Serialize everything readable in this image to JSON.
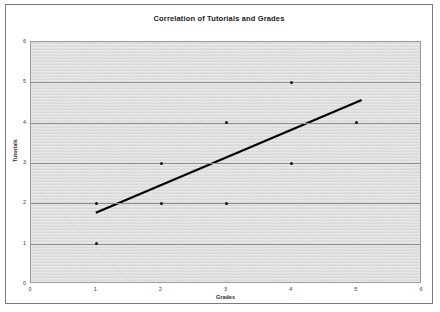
{
  "chart_data": {
    "type": "scatter",
    "title": "Correlation of Tutorials and Grades",
    "xlabel": "Grades",
    "ylabel": "Tutorials",
    "xlim": [
      0,
      6
    ],
    "ylim": [
      0,
      6
    ],
    "grid": true,
    "legend": "none",
    "x_ticks": [
      "0",
      "1",
      "2",
      "3",
      "4",
      "5",
      "6"
    ],
    "y_ticks": [
      "0",
      "1",
      "2",
      "3",
      "4",
      "5",
      "6"
    ],
    "series": [
      {
        "name": "Tutorials vs Grades",
        "marker": "dot",
        "color": "#111111",
        "points": [
          {
            "x": 1,
            "y": 1
          },
          {
            "x": 1,
            "y": 2
          },
          {
            "x": 2,
            "y": 2
          },
          {
            "x": 2,
            "y": 3
          },
          {
            "x": 3,
            "y": 2
          },
          {
            "x": 3,
            "y": 4
          },
          {
            "x": 4,
            "y": 3
          },
          {
            "x": 4,
            "y": 5
          },
          {
            "x": 5,
            "y": 4
          }
        ]
      }
    ],
    "trendline": {
      "name": "Linear trendline",
      "color": "#000000",
      "x_start": 1.0,
      "y_start": 1.73,
      "x_end": 5.1,
      "y_end": 4.55
    }
  }
}
